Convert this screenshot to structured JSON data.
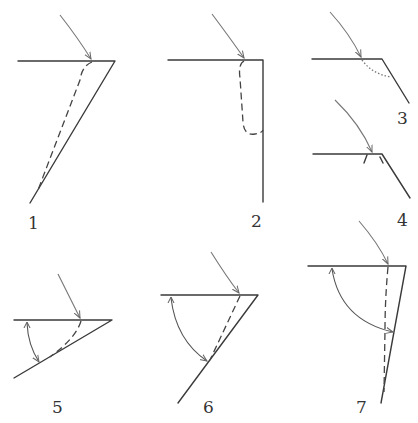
{
  "figure": {
    "panels": [
      {
        "id": "1",
        "label": "1"
      },
      {
        "id": "2",
        "label": "2"
      },
      {
        "id": "3",
        "label": "3"
      },
      {
        "id": "4",
        "label": "4"
      },
      {
        "id": "5",
        "label": "5"
      },
      {
        "id": "6",
        "label": "6"
      },
      {
        "id": "7",
        "label": "7"
      }
    ]
  },
  "colors": {
    "line": "#3a3a3a",
    "arrow": "#777777",
    "background": "#ffffff"
  }
}
